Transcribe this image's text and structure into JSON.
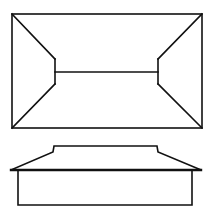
{
  "diagram": {
    "stroke_color": "#111111",
    "background": "#ffffff",
    "plan_view": {
      "outer_rect": {
        "x1": 12,
        "y1": 14,
        "x2": 202,
        "y2": 128
      },
      "ridge": {
        "x1": 55,
        "x2": 158,
        "y": 72
      },
      "left_hip_end": {
        "x": 55,
        "y_top": 59,
        "y_bottom": 84
      },
      "right_hip_end": {
        "x": 158,
        "y_top": 59,
        "y_bottom": 84
      }
    },
    "elevation_view": {
      "roof_top": {
        "x1": 54,
        "x2": 157,
        "y": 146
      },
      "roof_break": {
        "left": [
          53,
          151
        ],
        "right": [
          158,
          151
        ]
      },
      "eave_line": {
        "x1": 11,
        "x2": 201,
        "y": 170
      },
      "wall_box": {
        "x1": 18,
        "y1": 170,
        "x2": 192,
        "y2": 205
      }
    }
  }
}
